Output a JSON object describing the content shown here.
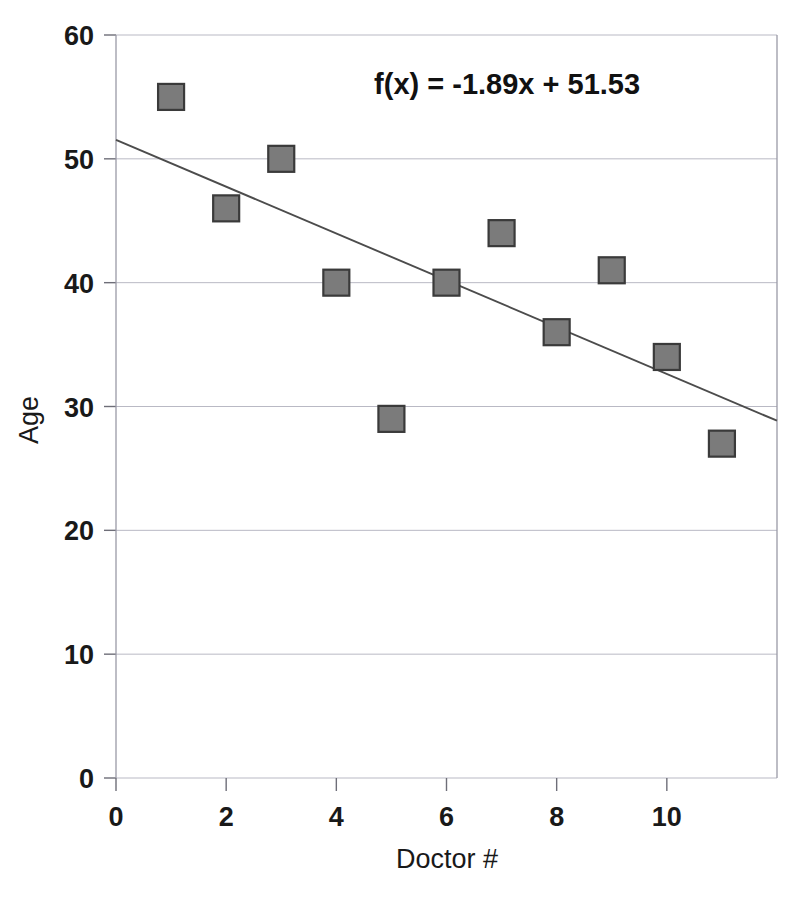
{
  "chart_data": {
    "type": "scatter",
    "title": "",
    "xlabel": "Doctor #",
    "ylabel": "Age",
    "xlim": [
      0,
      12
    ],
    "ylim": [
      0,
      60
    ],
    "grid": true,
    "legend": false,
    "x_ticks": [
      "0",
      "2",
      "4",
      "6",
      "8",
      "10"
    ],
    "x_tick_values": [
      0,
      2,
      4,
      6,
      8,
      10
    ],
    "y_ticks": [
      "0",
      "10",
      "20",
      "30",
      "40",
      "50",
      "60"
    ],
    "y_tick_values": [
      0,
      10,
      20,
      30,
      40,
      50,
      60
    ],
    "x": [
      1,
      2,
      3,
      4,
      5,
      6,
      7,
      8,
      9,
      10,
      11
    ],
    "y": [
      55,
      46,
      50,
      40,
      29,
      40,
      44,
      36,
      41,
      34,
      27
    ],
    "points": [
      {
        "x": 1,
        "y": 55
      },
      {
        "x": 2,
        "y": 46
      },
      {
        "x": 3,
        "y": 50
      },
      {
        "x": 4,
        "y": 40
      },
      {
        "x": 5,
        "y": 29
      },
      {
        "x": 6,
        "y": 40
      },
      {
        "x": 7,
        "y": 44
      },
      {
        "x": 8,
        "y": 36
      },
      {
        "x": 9,
        "y": 41
      },
      {
        "x": 10,
        "y": 34
      },
      {
        "x": 11,
        "y": 27
      }
    ],
    "annotations": [
      {
        "name": "trendline-equation",
        "text": "f(x) = -1.89x + 51.53",
        "x": 7.1,
        "y": 55.2
      }
    ],
    "trendline": {
      "name": "linear-fit",
      "equation": "f(x) = -1.89x + 51.53",
      "slope": -1.89,
      "intercept": 51.53,
      "x_start": 0,
      "x_end": 12
    },
    "colors": {
      "marker_fill": "#7b7b7b",
      "marker_edge": "#3a3a3a",
      "trendline": "#4c4c4c",
      "gridline": "#b9b9c4",
      "axis": "#9a9aa6",
      "text": "#191919",
      "background": "#ffffff"
    },
    "marker": {
      "shape": "square",
      "size_px": 26
    }
  }
}
